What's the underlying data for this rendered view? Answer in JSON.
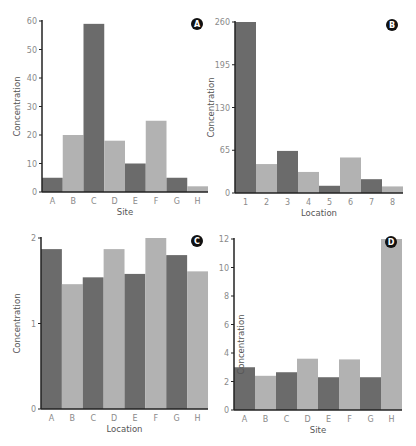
{
  "colors": {
    "dark": "#6b6b6b",
    "light": "#b2b2b2",
    "axis": "#222222",
    "badge": "#111111"
  },
  "chart_data": [
    {
      "type": "bar",
      "panel": "A",
      "title": "",
      "xlabel": "Site",
      "ylabel": "Concentration",
      "categories": [
        "A",
        "B",
        "C",
        "D",
        "E",
        "F",
        "G",
        "H"
      ],
      "values": [
        5,
        20,
        59,
        18,
        10,
        25,
        5,
        2
      ],
      "ylim": [
        0,
        60
      ],
      "yticks": [
        0,
        10,
        20,
        30,
        40,
        50,
        60
      ],
      "grid": false,
      "legend": "none",
      "badge_position": "top-right"
    },
    {
      "type": "bar",
      "panel": "B",
      "title": "",
      "xlabel": "Location",
      "ylabel": "Concentration",
      "categories": [
        "1",
        "2",
        "3",
        "4",
        "5",
        "6",
        "7",
        "8"
      ],
      "values": [
        260,
        44,
        64,
        32,
        11,
        54,
        21,
        10
      ],
      "ylim": [
        0,
        260
      ],
      "yticks": [
        0,
        65,
        130,
        195,
        260
      ],
      "grid": false,
      "legend": "none",
      "badge_position": "top-right"
    },
    {
      "type": "bar",
      "panel": "C",
      "title": "",
      "xlabel": "Location",
      "ylabel": "Concentration",
      "categories": [
        "A",
        "B",
        "C",
        "D",
        "E",
        "F",
        "G",
        "H"
      ],
      "values": [
        1.87,
        1.46,
        1.54,
        1.87,
        1.58,
        2.0,
        1.8,
        1.61
      ],
      "ylim": [
        0,
        2
      ],
      "yticks": [
        0,
        1,
        2
      ],
      "grid": false,
      "legend": "none",
      "badge_position": "top-right"
    },
    {
      "type": "bar",
      "panel": "D",
      "title": "",
      "xlabel": "Site",
      "ylabel": "Concentration",
      "categories": [
        "A",
        "B",
        "C",
        "D",
        "E",
        "F",
        "G",
        "H"
      ],
      "values": [
        3.0,
        2.4,
        2.65,
        3.6,
        2.3,
        3.55,
        2.3,
        12
      ],
      "ylim": [
        0,
        12
      ],
      "yticks": [
        0,
        2,
        4,
        6,
        8,
        10,
        12
      ],
      "grid": false,
      "legend": "none",
      "badge_position": "top-right"
    }
  ]
}
